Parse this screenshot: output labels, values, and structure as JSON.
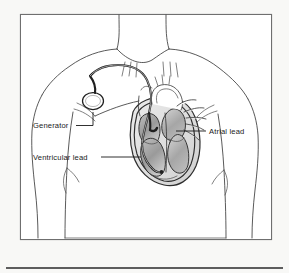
{
  "figure": {
    "background_color": "#f8f8f6",
    "frame_color": "#6f6f6f",
    "line_color": "#3c3c3c",
    "label_color": "#1a1a1a"
  },
  "labels": [
    {
      "id": "generator",
      "text": "Generator",
      "text_x": 33,
      "text_y": 128,
      "anchor": "start",
      "leader": "M 76,125.5 L 93,125.5 L 93,112"
    },
    {
      "id": "ventricular-lead",
      "text": "Ventricular lead",
      "text_x": 33,
      "text_y": 160,
      "anchor": "start",
      "leader": "M 101,157 L 141,157"
    },
    {
      "id": "atrial-lead",
      "text": "Atrial lead",
      "text_x": 209,
      "text_y": 134,
      "anchor": "start",
      "leader": "M 176,131 L 206,131"
    }
  ],
  "anatomy": {
    "parts": [
      "neck",
      "clavicle",
      "left-shoulder",
      "right-shoulder",
      "left-arm",
      "right-arm",
      "torso",
      "ribs",
      "heart",
      "aortic-arch",
      "pulmonary-vessels",
      "superior-vena-cava"
    ]
  },
  "device": {
    "generator_shape": "oval",
    "generator_center_x": 93,
    "generator_center_y": 101,
    "lead_count": 2,
    "lead_names": [
      "Atrial lead",
      "Ventricular lead"
    ]
  },
  "heart": {
    "chambers": [
      "right atrium",
      "right ventricle",
      "left atrium",
      "left ventricle"
    ],
    "shading": "gray-gradient"
  },
  "frame": {
    "x": 20,
    "y": 14,
    "width": 252,
    "height": 226
  },
  "bottom_rule": {
    "x1": 6,
    "x2": 283,
    "y": 268
  }
}
